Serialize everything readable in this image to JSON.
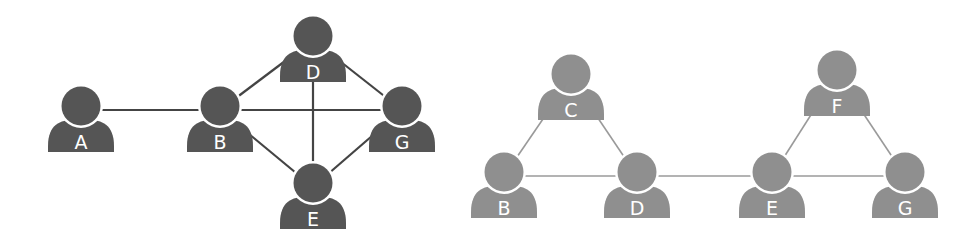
{
  "diagrams": [
    {
      "id": "left",
      "node_color": "#555555",
      "edge_color": "#444444",
      "nodes": [
        {
          "id": "A",
          "label": "A"
        },
        {
          "id": "B",
          "label": "B"
        },
        {
          "id": "D",
          "label": "D"
        },
        {
          "id": "G",
          "label": "G"
        },
        {
          "id": "E",
          "label": "E"
        }
      ],
      "edges": [
        [
          "A",
          "B"
        ],
        [
          "B",
          "G"
        ],
        [
          "B",
          "D"
        ],
        [
          "D",
          "G"
        ],
        [
          "D",
          "E"
        ],
        [
          "B",
          "E"
        ],
        [
          "E",
          "G"
        ]
      ]
    },
    {
      "id": "right",
      "node_color": "#8f8f8f",
      "edge_color": "#9a9a9a",
      "nodes": [
        {
          "id": "C",
          "label": "C"
        },
        {
          "id": "F",
          "label": "F"
        },
        {
          "id": "B",
          "label": "B"
        },
        {
          "id": "D",
          "label": "D"
        },
        {
          "id": "E",
          "label": "E"
        },
        {
          "id": "G",
          "label": "G"
        }
      ],
      "edges": [
        [
          "C",
          "B"
        ],
        [
          "C",
          "D"
        ],
        [
          "B",
          "D"
        ],
        [
          "D",
          "E"
        ],
        [
          "E",
          "G"
        ],
        [
          "F",
          "E"
        ],
        [
          "F",
          "G"
        ]
      ]
    }
  ]
}
